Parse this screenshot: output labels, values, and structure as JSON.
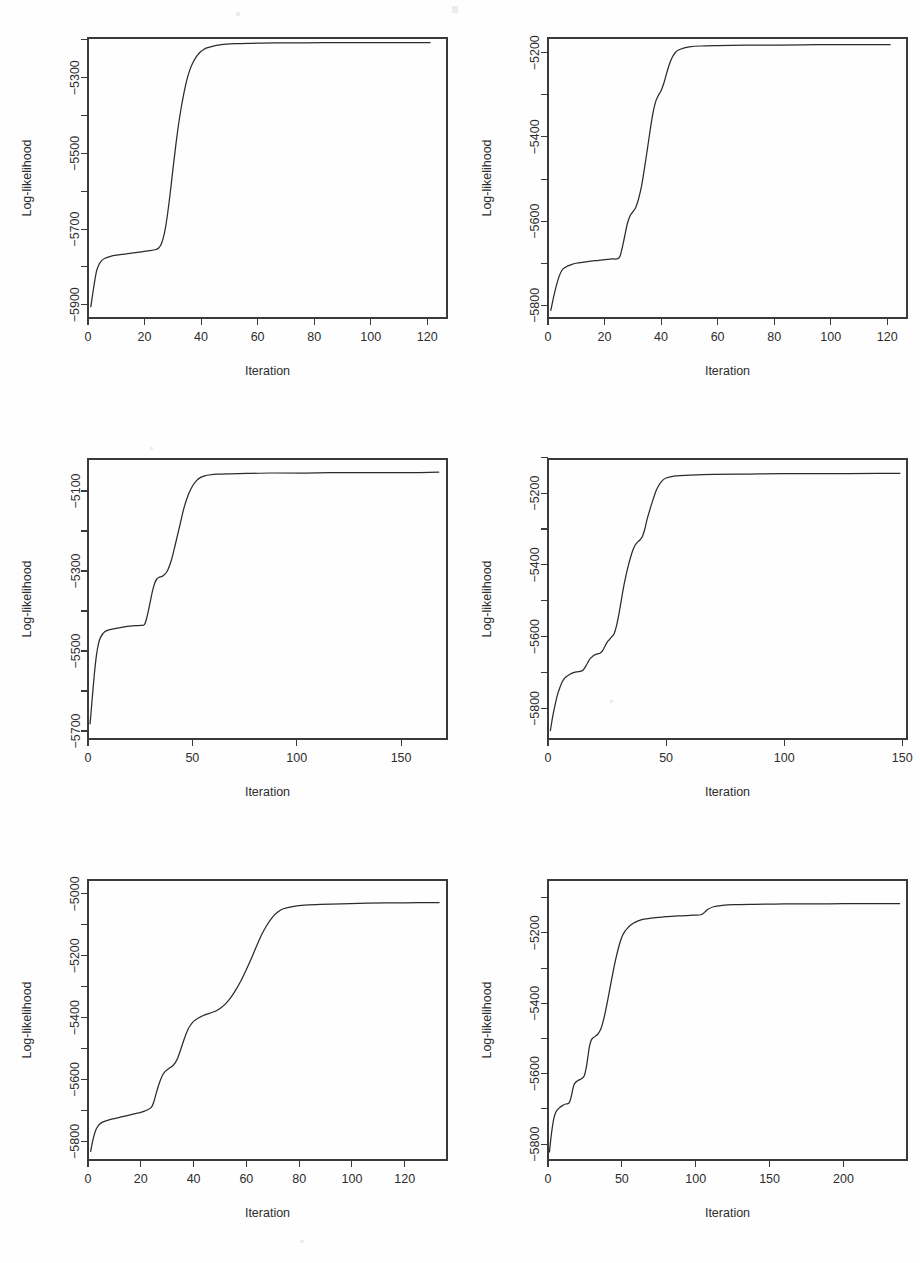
{
  "figure": {
    "kind": "multi-panel-line-figure",
    "panel_count": 6,
    "columns": 2,
    "rows": 3,
    "line_color": "#2b2b2b",
    "axis_color": "#3a3a3a",
    "background": "#ffffff"
  },
  "chart_data": [
    {
      "id": "panel-1",
      "position": "top-left",
      "type": "line",
      "title": "",
      "xlabel": "Iteration",
      "ylabel": "Log-likelihood",
      "grid": false,
      "legend": "none",
      "xticks": [
        0,
        20,
        40,
        60,
        80,
        100,
        120
      ],
      "yticks": [
        -5900,
        -5700,
        -5500,
        -5300
      ],
      "xlim": [
        0,
        127
      ],
      "ylim": [
        -5935,
        -5195
      ],
      "x": [
        1,
        2,
        3,
        4,
        5,
        6,
        8,
        10,
        13,
        16,
        19,
        22,
        24,
        25,
        26,
        27,
        28,
        29,
        30,
        31,
        32,
        33,
        34,
        35,
        36,
        37,
        38,
        39,
        40,
        41,
        42,
        44,
        46,
        48,
        52,
        58,
        66,
        76,
        88,
        100,
        110,
        121
      ],
      "y": [
        -5905,
        -5855,
        -5812,
        -5792,
        -5782,
        -5777,
        -5772,
        -5769,
        -5766,
        -5763,
        -5760,
        -5757,
        -5754,
        -5750,
        -5738,
        -5712,
        -5668,
        -5610,
        -5545,
        -5482,
        -5425,
        -5378,
        -5338,
        -5305,
        -5280,
        -5262,
        -5248,
        -5238,
        -5230,
        -5225,
        -5221,
        -5217,
        -5214,
        -5212,
        -5210,
        -5209,
        -5208,
        -5208,
        -5207,
        -5207,
        -5207,
        -5207
      ]
    },
    {
      "id": "panel-2",
      "position": "top-right",
      "type": "line",
      "title": "",
      "xlabel": "Iteration",
      "ylabel": "Log-likelihood",
      "grid": false,
      "legend": "none",
      "xticks": [
        0,
        20,
        40,
        60,
        80,
        100,
        120
      ],
      "yticks": [
        -5800,
        -5600,
        -5400,
        -5200
      ],
      "xlim": [
        0,
        127
      ],
      "ylim": [
        -5830,
        -5165
      ],
      "x": [
        1,
        2,
        3,
        4,
        5,
        6,
        8,
        10,
        14,
        18,
        22,
        25,
        26,
        27,
        28,
        29,
        30,
        31,
        32,
        33,
        34,
        35,
        36,
        37,
        38,
        39,
        40,
        41,
        42,
        43,
        44,
        45,
        46,
        48,
        50,
        54,
        60,
        70,
        82,
        95,
        108,
        121
      ],
      "y": [
        -5812,
        -5780,
        -5752,
        -5730,
        -5716,
        -5710,
        -5704,
        -5700,
        -5696,
        -5693,
        -5690,
        -5688,
        -5670,
        -5640,
        -5608,
        -5588,
        -5578,
        -5568,
        -5548,
        -5520,
        -5480,
        -5436,
        -5390,
        -5348,
        -5318,
        -5302,
        -5290,
        -5272,
        -5248,
        -5226,
        -5210,
        -5200,
        -5194,
        -5189,
        -5186,
        -5184,
        -5183,
        -5182,
        -5182,
        -5181,
        -5181,
        -5181
      ]
    },
    {
      "id": "panel-3",
      "position": "middle-left",
      "type": "line",
      "title": "",
      "xlabel": "Iteration",
      "ylabel": "Log-likelihood",
      "grid": false,
      "legend": "none",
      "xticks": [
        0,
        50,
        100,
        150
      ],
      "yticks": [
        -5700,
        -5500,
        -5300,
        -5100
      ],
      "xlim": [
        0,
        172
      ],
      "ylim": [
        -5720,
        -5020
      ],
      "x": [
        1,
        2,
        3,
        4,
        5,
        6,
        8,
        11,
        15,
        20,
        25,
        27,
        28,
        29,
        30,
        31,
        32,
        33,
        34,
        36,
        38,
        40,
        42,
        44,
        46,
        48,
        50,
        52,
        54,
        56,
        58,
        62,
        68,
        76,
        88,
        104,
        122,
        140,
        155,
        168
      ],
      "y": [
        -5682,
        -5620,
        -5560,
        -5512,
        -5482,
        -5466,
        -5452,
        -5446,
        -5442,
        -5438,
        -5436,
        -5434,
        -5420,
        -5398,
        -5372,
        -5348,
        -5330,
        -5320,
        -5316,
        -5312,
        -5300,
        -5272,
        -5230,
        -5186,
        -5142,
        -5110,
        -5088,
        -5074,
        -5066,
        -5062,
        -5060,
        -5058,
        -5057,
        -5056,
        -5055,
        -5055,
        -5054,
        -5054,
        -5054,
        -5053
      ]
    },
    {
      "id": "panel-4",
      "position": "middle-right",
      "type": "line",
      "title": "",
      "xlabel": "Iteration",
      "ylabel": "Log-likelihood",
      "grid": false,
      "legend": "none",
      "xticks": [
        0,
        50,
        100,
        150
      ],
      "yticks": [
        -5800,
        -5600,
        -5400,
        -5200
      ],
      "xlim": [
        0,
        152
      ],
      "ylim": [
        -5885,
        -5105
      ],
      "x": [
        1,
        2,
        3,
        4,
        5,
        6,
        7,
        8,
        10,
        12,
        14,
        15,
        16,
        17,
        18,
        19,
        20,
        21,
        22,
        23,
        24,
        25,
        26,
        27,
        28,
        29,
        30,
        31,
        32,
        33,
        34,
        35,
        36,
        37,
        38,
        39,
        40,
        41,
        42,
        44,
        46,
        48,
        50,
        54,
        60,
        70,
        85,
        100,
        120,
        140,
        149
      ],
      "y": [
        -5862,
        -5822,
        -5790,
        -5762,
        -5742,
        -5726,
        -5716,
        -5710,
        -5702,
        -5698,
        -5696,
        -5692,
        -5682,
        -5670,
        -5660,
        -5654,
        -5650,
        -5648,
        -5646,
        -5640,
        -5628,
        -5616,
        -5608,
        -5600,
        -5592,
        -5570,
        -5538,
        -5500,
        -5462,
        -5430,
        -5402,
        -5378,
        -5358,
        -5344,
        -5336,
        -5330,
        -5320,
        -5300,
        -5272,
        -5228,
        -5190,
        -5168,
        -5158,
        -5152,
        -5150,
        -5148,
        -5147,
        -5146,
        -5146,
        -5145,
        -5145
      ]
    },
    {
      "id": "panel-5",
      "position": "bottom-left",
      "type": "line",
      "title": "",
      "xlabel": "Iteration",
      "ylabel": "Log-likelihood",
      "grid": false,
      "legend": "none",
      "xticks": [
        0,
        20,
        40,
        60,
        80,
        100,
        120
      ],
      "yticks": [
        -5800,
        -5600,
        -5400,
        -5200,
        -5000
      ],
      "xlim": [
        0,
        136
      ],
      "ylim": [
        -5860,
        -4955
      ],
      "x": [
        1,
        2,
        3,
        4,
        5,
        6,
        8,
        10,
        12,
        14,
        16,
        18,
        20,
        22,
        24,
        25,
        26,
        27,
        28,
        29,
        30,
        31,
        32,
        33,
        34,
        35,
        36,
        37,
        38,
        39,
        40,
        42,
        44,
        46,
        48,
        50,
        52,
        54,
        56,
        58,
        60,
        62,
        64,
        66,
        68,
        70,
        72,
        74,
        78,
        82,
        88,
        96,
        106,
        116,
        126,
        133
      ],
      "y": [
        -5832,
        -5790,
        -5762,
        -5748,
        -5740,
        -5736,
        -5730,
        -5726,
        -5722,
        -5718,
        -5714,
        -5710,
        -5706,
        -5700,
        -5690,
        -5670,
        -5640,
        -5612,
        -5590,
        -5576,
        -5568,
        -5562,
        -5556,
        -5546,
        -5530,
        -5506,
        -5480,
        -5456,
        -5436,
        -5422,
        -5412,
        -5400,
        -5392,
        -5386,
        -5380,
        -5370,
        -5356,
        -5336,
        -5310,
        -5280,
        -5244,
        -5206,
        -5166,
        -5128,
        -5098,
        -5074,
        -5058,
        -5048,
        -5040,
        -5036,
        -5034,
        -5032,
        -5030,
        -5029,
        -5028,
        -5028
      ]
    },
    {
      "id": "panel-6",
      "position": "bottom-right",
      "type": "line",
      "title": "",
      "xlabel": "Iteration",
      "ylabel": "Log-likelihood",
      "grid": false,
      "legend": "none",
      "xticks": [
        0,
        50,
        100,
        150,
        200
      ],
      "yticks": [
        -5800,
        -5600,
        -5400,
        -5200
      ],
      "xlim": [
        0,
        243
      ],
      "ylim": [
        -5845,
        -5050
      ],
      "x": [
        1,
        2,
        3,
        4,
        5,
        6,
        8,
        10,
        12,
        14,
        15,
        16,
        17,
        18,
        20,
        22,
        24,
        25,
        26,
        27,
        28,
        29,
        30,
        32,
        34,
        36,
        38,
        40,
        42,
        44,
        46,
        48,
        50,
        52,
        54,
        56,
        58,
        60,
        64,
        70,
        78,
        88,
        98,
        104,
        108,
        112,
        118,
        126,
        140,
        160,
        180,
        200,
        220,
        238
      ],
      "y": [
        -5822,
        -5782,
        -5750,
        -5726,
        -5712,
        -5704,
        -5696,
        -5690,
        -5686,
        -5684,
        -5676,
        -5660,
        -5640,
        -5628,
        -5620,
        -5616,
        -5610,
        -5600,
        -5580,
        -5552,
        -5524,
        -5508,
        -5500,
        -5494,
        -5486,
        -5470,
        -5440,
        -5400,
        -5356,
        -5312,
        -5272,
        -5238,
        -5212,
        -5196,
        -5186,
        -5178,
        -5172,
        -5168,
        -5162,
        -5158,
        -5155,
        -5152,
        -5150,
        -5148,
        -5134,
        -5126,
        -5122,
        -5120,
        -5119,
        -5118,
        -5118,
        -5117,
        -5117,
        -5117
      ]
    }
  ]
}
